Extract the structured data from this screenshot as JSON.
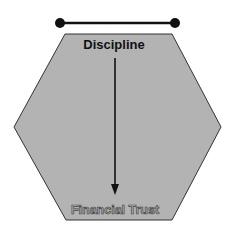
{
  "diagram": {
    "top_connector": {
      "x1": 60,
      "y1": 23,
      "x2": 175,
      "y2": 23,
      "color": "#111111"
    },
    "hexagon": {
      "fill": "#b3b3b3",
      "stroke": "#333333",
      "points": "65,34 172,34 221,127 172,220 66,220 14,127"
    },
    "top_label": "Discipline",
    "bottom_label": "Financial Trust",
    "arrow": {
      "from": "Discipline",
      "to": "Financial Trust",
      "x": 115,
      "y1": 58,
      "y2": 194,
      "color": "#111111"
    }
  }
}
